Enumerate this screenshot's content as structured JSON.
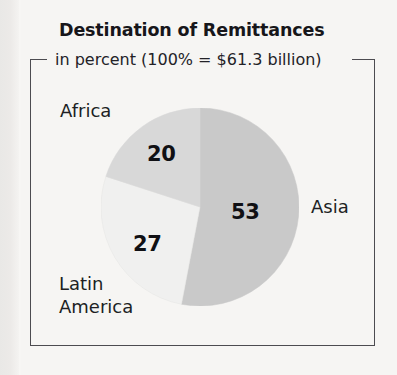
{
  "figure": {
    "title": "Destination of Remittances",
    "subtitle": "in percent (100% = $61.3 billion)"
  },
  "colors": {
    "background": "#f6f5f3",
    "frame_border": "#4c4b50",
    "text": "#201f24",
    "asia_slice": "#c9c9c9",
    "latin_america_slice": "#f0f0ef",
    "africa_slice": "#d8d8d8"
  },
  "labels": {
    "africa": "Africa",
    "asia": "Asia",
    "latin_america_line1": "Latin",
    "latin_america_line2": "America"
  },
  "values": {
    "asia": "53",
    "latin_america": "27",
    "africa": "20"
  },
  "chart_data": {
    "type": "pie",
    "title": "Destination of Remittances",
    "subtitle": "in percent (100% = $61.3 billion)",
    "unit": "percent",
    "total_label": "100% = $61.3 billion",
    "total_value": 61.3,
    "total_unit": "billion USD",
    "categories": [
      "Asia",
      "Latin America",
      "Africa"
    ],
    "values": [
      53,
      27,
      20
    ],
    "slice_colors": [
      "#c9c9c9",
      "#f0f0ef",
      "#d8d8d8"
    ],
    "start_angle_deg": 0,
    "direction": "clockwise",
    "legend": "none",
    "data_labels": "inside slices",
    "grid": false
  }
}
